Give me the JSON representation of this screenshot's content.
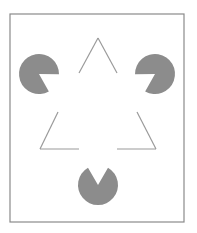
{
  "figure": {
    "name": "Kanizsa triangle illusion",
    "colors": {
      "background": "#ffffff",
      "frame": "#8a8a8a",
      "pacman_fill": "#8c8c8c",
      "line": "#9a9a9a"
    },
    "frame": {
      "x": 10,
      "y": 14,
      "w": 174,
      "h": 208
    },
    "pacmen": [
      {
        "id": "left",
        "cx": 39,
        "cy": 74,
        "r": 20
      },
      {
        "id": "right",
        "cx": 155,
        "cy": 74,
        "r": 20
      },
      {
        "id": "bottom",
        "cx": 98,
        "cy": 185,
        "r": 20
      }
    ],
    "line_segments": [
      {
        "id": "apex-left",
        "x1": 98,
        "y1": 38,
        "x2": 79,
        "y2": 73
      },
      {
        "id": "apex-right",
        "x1": 98,
        "y1": 38,
        "x2": 117,
        "y2": 73
      },
      {
        "id": "lower-left-diagonal",
        "x1": 58,
        "y1": 112,
        "x2": 40,
        "y2": 149
      },
      {
        "id": "lower-left-base",
        "x1": 40,
        "y1": 149,
        "x2": 79,
        "y2": 149
      },
      {
        "id": "lower-right-diagonal",
        "x1": 137,
        "y1": 112,
        "x2": 156,
        "y2": 149
      },
      {
        "id": "lower-right-base",
        "x1": 117,
        "y1": 149,
        "x2": 156,
        "y2": 149
      }
    ]
  }
}
